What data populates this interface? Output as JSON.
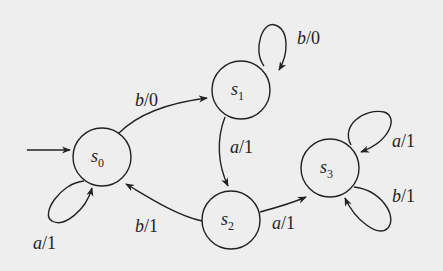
{
  "diagram": {
    "type": "finite-state-machine",
    "colors": {
      "background": "#eeeeee",
      "stroke": "#222222"
    },
    "start_state": "s0",
    "states": [
      {
        "id": "s0",
        "base": "s",
        "sub": "0"
      },
      {
        "id": "s1",
        "base": "s",
        "sub": "1"
      },
      {
        "id": "s2",
        "base": "s",
        "sub": "2"
      },
      {
        "id": "s3",
        "base": "s",
        "sub": "3"
      }
    ],
    "transitions": [
      {
        "from": "s0",
        "to": "s0",
        "input": "a",
        "output": "1",
        "label": "a/1"
      },
      {
        "from": "s0",
        "to": "s1",
        "input": "b",
        "output": "0",
        "label": "b/0"
      },
      {
        "from": "s1",
        "to": "s1",
        "input": "b",
        "output": "0",
        "label": "b/0"
      },
      {
        "from": "s1",
        "to": "s2",
        "input": "a",
        "output": "1",
        "label": "a/1"
      },
      {
        "from": "s2",
        "to": "s0",
        "input": "b",
        "output": "1",
        "label": "b/1"
      },
      {
        "from": "s2",
        "to": "s3",
        "input": "a",
        "output": "1",
        "label": "a/1"
      },
      {
        "from": "s3",
        "to": "s3",
        "input": "a",
        "output": "1",
        "label": "a/1"
      },
      {
        "from": "s3",
        "to": "s3",
        "input": "b",
        "output": "1",
        "label": "b/1"
      }
    ]
  }
}
